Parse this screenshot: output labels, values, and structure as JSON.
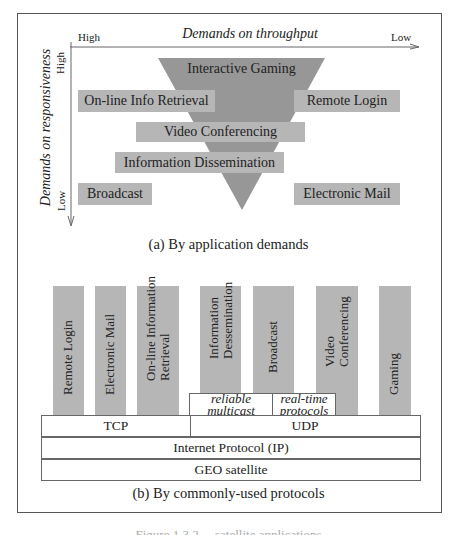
{
  "colors": {
    "triangle": "#979797",
    "bar": "#b6b6b6",
    "border": "#555555"
  },
  "panel_a": {
    "x_axis": {
      "title": "Demands on throughput",
      "left": "High",
      "right": "Low"
    },
    "y_axis": {
      "title": "Demands on responsiveness",
      "top": "High",
      "bottom": "Low"
    },
    "triangle_label": "Interactive Gaming",
    "bars": [
      {
        "label": "On-line Info Retrieval"
      },
      {
        "label": "Remote Login"
      },
      {
        "label": "Video Conferencing"
      },
      {
        "label": "Information Dissemination"
      },
      {
        "label": "Broadcast"
      },
      {
        "label": "Electronic Mail"
      }
    ],
    "caption": "(a) By application demands"
  },
  "panel_b": {
    "apps": [
      {
        "line1": "Remote Login",
        "line2": ""
      },
      {
        "line1": "Electronic Mail",
        "line2": ""
      },
      {
        "line1": "On-line Information",
        "line2": "Retrieval"
      },
      {
        "line1": "Information",
        "line2": "Dessemination"
      },
      {
        "line1": "Broadcast",
        "line2": ""
      },
      {
        "line1": "Video",
        "line2": "Conferencing"
      },
      {
        "line1": "Gaming",
        "line2": ""
      }
    ],
    "udp_extensions": [
      {
        "line1": "reliable",
        "line2": "multicast"
      },
      {
        "line1": "real-time",
        "line2": "protocols"
      }
    ],
    "layers": {
      "transport": [
        "TCP",
        "UDP"
      ],
      "network": "Internet Protocol (IP)",
      "link": "GEO satellite"
    },
    "caption": "(b) By commonly-used protocols"
  },
  "figure_caption": "Figure 1.3.2  ...  satellite applications"
}
